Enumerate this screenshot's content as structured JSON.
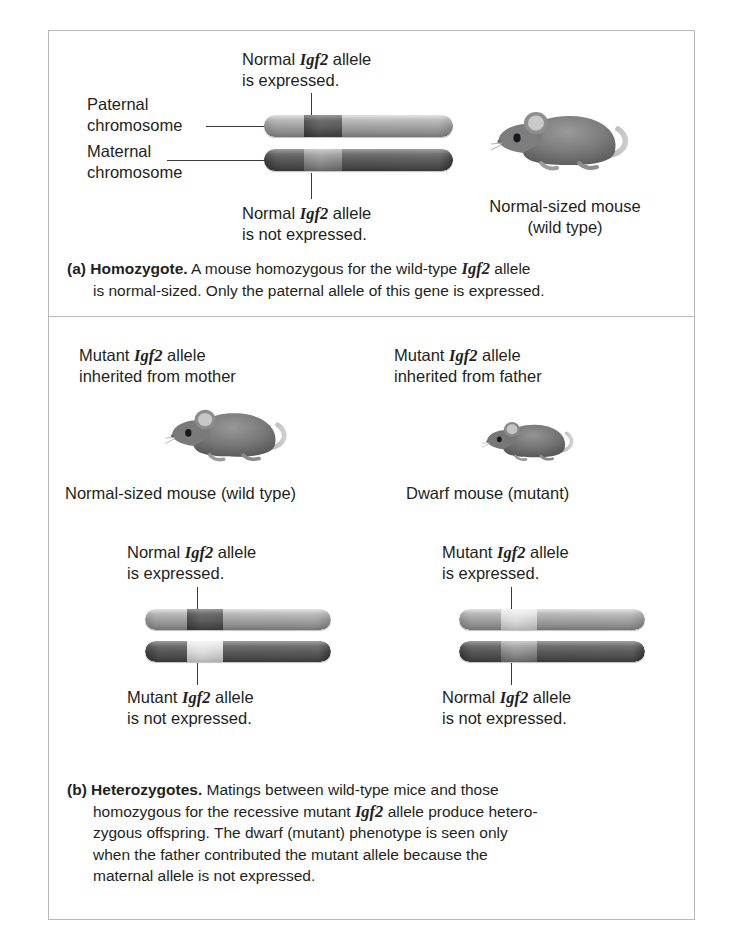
{
  "figure": {
    "panel_a": {
      "labels": {
        "paternal_chromosome": "Paternal\nchromosome",
        "maternal_chromosome": "Maternal\nchromosome",
        "top_callout": "Normal Igf2 allele\nis expressed.",
        "top_callout_pre": "Normal ",
        "top_callout_gene": "Igf2",
        "top_callout_post": " allele\nis expressed.",
        "bottom_callout_pre": "Normal ",
        "bottom_callout_gene": "Igf2",
        "bottom_callout_post": " allele\nis not expressed.",
        "mouse_label": "Normal-sized mouse\n(wild type)"
      },
      "caption": {
        "tag": "(a) Homozygote.",
        "line1": " A mouse homozygous for the wild-type ",
        "gene": "Igf2",
        "line1_end": " allele",
        "line2": "is normal-sized. Only the paternal allele of this gene is expressed."
      }
    },
    "panel_b": {
      "left": {
        "inherit_pre": "Mutant ",
        "inherit_gene": "Igf2",
        "inherit_post": " allele\ninherited from mother",
        "mouse_label": "Normal-sized mouse (wild type)",
        "top_callout_pre": "Normal ",
        "top_callout_gene": "Igf2",
        "top_callout_post": " allele\nis expressed.",
        "bottom_callout_pre": "Mutant ",
        "bottom_callout_gene": "Igf2",
        "bottom_callout_post": " allele\nis not expressed."
      },
      "right": {
        "inherit_pre": "Mutant ",
        "inherit_gene": "Igf2",
        "inherit_post": " allele\ninherited from father",
        "mouse_label": "Dwarf mouse (mutant)",
        "top_callout_pre": "Mutant ",
        "top_callout_gene": "Igf2",
        "top_callout_post": " allele\nis expressed.",
        "bottom_callout_pre": "Normal ",
        "bottom_callout_gene": "Igf2",
        "bottom_callout_post": " allele\nis not expressed."
      },
      "caption": {
        "tag": "(b) Heterozygotes.",
        "line1": " Matings between wild-type mice and those",
        "line2_pre": "homozygous for the recessive mutant ",
        "gene": "Igf2",
        "line2_post": " allele produce hetero-",
        "line3": "zygous offspring. The dwarf (mutant) phenotype is seen only",
        "line4": "when the father contributed the mutant allele because the",
        "line5": "maternal allele is not expressed."
      }
    },
    "colors": {
      "frame_border": "#b9b9b9",
      "text": "#231f20",
      "chromosome_light": "#a5a5a5",
      "chromosome_dark": "#555555",
      "band_dark": "#5a5a5a",
      "band_pale": "#d6d6d6",
      "band_mid": "#8c8c8c",
      "leader_line": "#3a3a3a"
    }
  }
}
